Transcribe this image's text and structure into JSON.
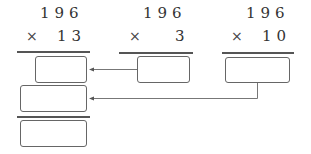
{
  "problem_a": {
    "multiplicand": "196",
    "operator": "×",
    "multiplier": "13"
  },
  "problem_b": {
    "multiplicand": "196",
    "operator": "×",
    "multiplier": "3"
  },
  "problem_c": {
    "multiplicand": "196",
    "operator": "×",
    "multiplier": "10"
  },
  "boxes": {
    "partial_product_1": "",
    "partial_product_2": "",
    "product_b": "",
    "product_c": "",
    "final_sum": ""
  },
  "colors": {
    "line": "#555555",
    "box_border": "#666666",
    "arrow": "#777777"
  }
}
